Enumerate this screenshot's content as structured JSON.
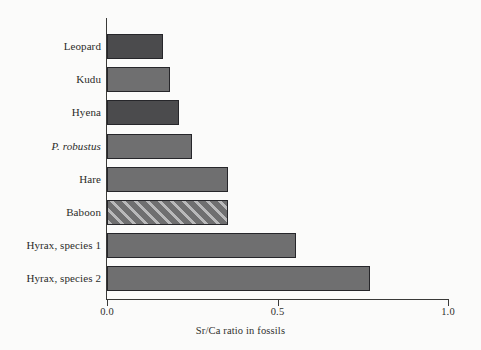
{
  "chart_data": {
    "type": "bar",
    "orientation": "horizontal",
    "title": "",
    "xlabel": "Sr/Ca ratio in fossils",
    "ylabel": "",
    "xlim": [
      0.0,
      1.0
    ],
    "xticks": [
      "0.0",
      "0.5",
      "1.0"
    ],
    "xtick_values": [
      0.0,
      0.5,
      1.0
    ],
    "grid": false,
    "legend": null,
    "categories": [
      "Leopard",
      "Kudu",
      "Hyena",
      "P. robustus",
      "Hare",
      "Baboon",
      "Hyrax, species 1",
      "Hyrax, species 2"
    ],
    "values": [
      0.165,
      0.185,
      0.21,
      0.25,
      0.355,
      0.355,
      0.555,
      0.77
    ],
    "bars": [
      {
        "label": "Leopard",
        "value": 0.165,
        "style": "fill-dark",
        "italic": false
      },
      {
        "label": "Kudu",
        "value": 0.185,
        "style": "fill-medium",
        "italic": false
      },
      {
        "label": "Hyena",
        "value": 0.21,
        "style": "fill-dark",
        "italic": false
      },
      {
        "label": "P. robustus",
        "value": 0.25,
        "style": "fill-medium",
        "italic": true
      },
      {
        "label": "Hare",
        "value": 0.355,
        "style": "fill-medium",
        "italic": false
      },
      {
        "label": "Baboon",
        "value": 0.355,
        "style": "fill-hatch",
        "italic": false
      },
      {
        "label": "Hyrax, species 1",
        "value": 0.555,
        "style": "fill-medium",
        "italic": false
      },
      {
        "label": "Hyrax, species 2",
        "value": 0.77,
        "style": "fill-medium",
        "italic": false
      }
    ],
    "colors": {
      "dark_gray": "#4b4b4d",
      "medium_gray": "#6f6f70",
      "hatch_stripe": "#b9b9ba",
      "bar_outline": "#26262a",
      "axis": "#3a3a38",
      "background": "#fbfbfa",
      "text": "#2b2b29"
    }
  },
  "axis": {
    "x_title": "Sr/Ca ratio in fossils",
    "ticks": [
      "0.0",
      "0.5",
      "1.0"
    ]
  }
}
